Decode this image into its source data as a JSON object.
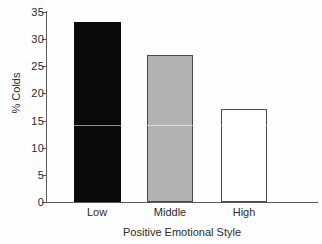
{
  "chart_data": {
    "type": "bar",
    "title": "",
    "categories": [
      "Low",
      "Middle",
      "High"
    ],
    "values": [
      33.2,
      27.1,
      17.2
    ],
    "series": [
      {
        "name": "% Colds",
        "values": [
          33.2,
          27.1,
          17.2
        ]
      }
    ],
    "xlabel": "Positive Emotional Style",
    "ylabel": "% Colds",
    "ylim": [
      0,
      35
    ],
    "yticks": [
      0,
      5,
      10,
      15,
      20,
      25,
      30,
      35
    ],
    "ytick_labels": [
      "0",
      "5",
      "10",
      "15",
      "20",
      "25",
      "30",
      "35"
    ],
    "grid": false,
    "legend": false,
    "bar_colors": [
      "#0a0a0a",
      "#b2b2b2",
      "#ffffff"
    ],
    "bar_edge_colors": [
      "#0a0a0a",
      "#4a4a4a",
      "#4a4a4a"
    ],
    "axis_color": "#5a5a5a"
  },
  "axes": {
    "y_title": "% Colds",
    "x_title": "Positive Emotional Style"
  }
}
